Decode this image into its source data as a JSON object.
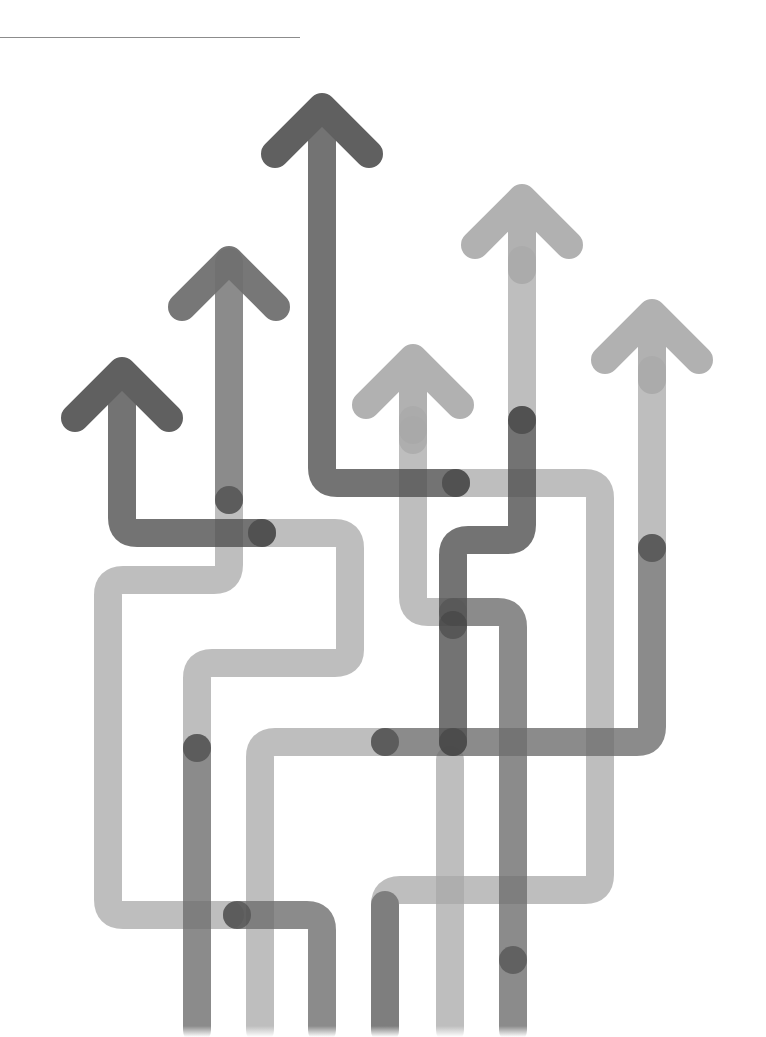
{
  "illustration": {
    "subject": "growth arrows rising upward from intertwined paths",
    "palette": {
      "background": "#ffffff",
      "rule": "#8c8c8c",
      "dark": "#505050",
      "mid": "#6e6e6e",
      "light": "#a8a8a8"
    },
    "arrow_count": 6,
    "stroke_width": 28
  }
}
